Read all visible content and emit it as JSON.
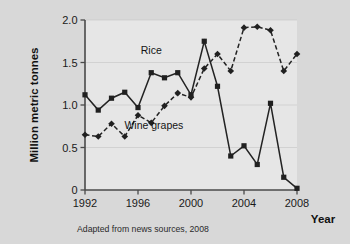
{
  "chart_data": {
    "type": "line",
    "title": "",
    "xlabel": "Year",
    "ylabel": "Million metric tonnes",
    "xlim": [
      1992,
      2008
    ],
    "ylim": [
      0,
      2.0
    ],
    "xticks": [
      "1992",
      "1996",
      "2000",
      "2004",
      "2008"
    ],
    "xtick_values": [
      1992,
      1996,
      2000,
      2004,
      2008
    ],
    "yticks": [
      "0",
      "0.5",
      "1.0",
      "1.5",
      "2.0"
    ],
    "ytick_values": [
      0,
      0.5,
      1.0,
      1.5,
      2.0
    ],
    "grid": true,
    "legend_position": "inline-annotation",
    "x": [
      1992,
      1993,
      1994,
      1995,
      1996,
      1997,
      1998,
      1999,
      2000,
      2001,
      2002,
      2003,
      2004,
      2005,
      2006,
      2007,
      2008
    ],
    "series": [
      {
        "name": "Rice",
        "marker": "square",
        "linestyle": "solid",
        "values": [
          1.12,
          0.94,
          1.08,
          1.15,
          0.97,
          1.38,
          1.32,
          1.38,
          1.12,
          1.75,
          1.22,
          0.4,
          0.52,
          0.3,
          1.02,
          0.15,
          0.02
        ]
      },
      {
        "name": "Wine grapes",
        "marker": "diamond",
        "linestyle": "dashed",
        "values": [
          0.65,
          0.63,
          0.78,
          0.63,
          0.88,
          0.79,
          0.99,
          1.14,
          1.09,
          1.43,
          1.6,
          1.4,
          1.91,
          1.92,
          1.88,
          1.4,
          1.6
        ]
      }
    ],
    "annotations": [
      {
        "text": "Rice",
        "x": 1997.0,
        "y": 1.6
      },
      {
        "text": "Wine grapes",
        "x": 1997.2,
        "y": 0.72
      }
    ]
  },
  "caption": {
    "source_note": "Adapted from news sources, 2008"
  },
  "colors": {
    "plot_background": "#e6e6e6",
    "page_background": "#d8d8d8",
    "line": "#232323",
    "axis": "#4a4a4a",
    "grid": "#c9c9c9"
  }
}
